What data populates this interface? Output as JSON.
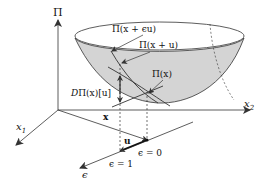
{
  "figure": {
    "axes": {
      "vertical": "Π",
      "x1": "x",
      "x1_sub": "1",
      "x2": "x",
      "x2_sub": "2"
    },
    "labels": {
      "pi_x_eps_u": "Π(x + ϵu)",
      "pi_x_u": "Π(x + u)",
      "pi_x": "Π(x)",
      "derivative_D": "D",
      "derivative_rest": "Π(x)[u]",
      "x_vec": "x",
      "u_vec": "u",
      "eps_zero": "ϵ = 0",
      "eps_one": "ϵ = 1",
      "eps_axis": "ϵ"
    },
    "colors": {
      "surface_fill": "#d4d4d4",
      "stroke": "#333333",
      "background": "#ffffff"
    }
  }
}
